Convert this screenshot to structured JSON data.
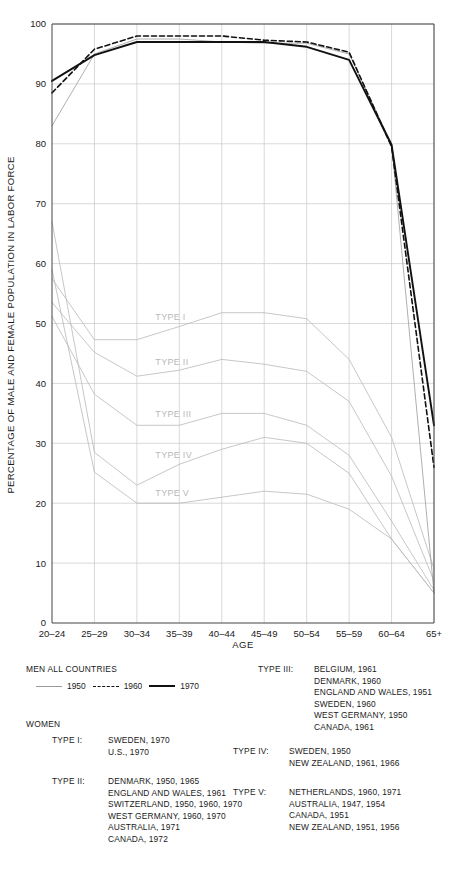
{
  "chart_data": {
    "type": "line",
    "title": "",
    "xlabel": "AGE",
    "ylabel": "PERCENTAGE OF MALE AND FEMALE POPULATION IN LABOR FORCE",
    "categories": [
      "20–24",
      "25–29",
      "30–34",
      "35–39",
      "40–44",
      "45–49",
      "50–54",
      "55–59",
      "60–64",
      "65+"
    ],
    "ylim": [
      0,
      100
    ],
    "yticks": [
      0,
      10,
      20,
      30,
      40,
      50,
      60,
      70,
      80,
      90,
      100
    ],
    "grid": true,
    "legend_position": "below-plot",
    "series": [
      {
        "name": "MEN ALL COUNTRIES 1950",
        "group": "men",
        "year": "1950",
        "style": "thin-grey-solid",
        "color": "#9a9a9a",
        "values": [
          83,
          95,
          97.5,
          97.5,
          97,
          96.8,
          96.8,
          95,
          80,
          5
        ]
      },
      {
        "name": "MEN ALL COUNTRIES 1960",
        "group": "men",
        "year": "1960",
        "style": "dashed-black",
        "color": "#111111",
        "values": [
          88.5,
          95.8,
          98,
          98,
          98,
          97.3,
          97,
          95.3,
          79.5,
          26
        ]
      },
      {
        "name": "MEN ALL COUNTRIES 1970",
        "group": "men",
        "year": "1970",
        "style": "thick-black-solid",
        "color": "#111111",
        "values": [
          90.5,
          94.8,
          97,
          97,
          97,
          97,
          96.2,
          94,
          79.8,
          33
        ]
      },
      {
        "name": "TYPE I",
        "group": "women",
        "style": "thin-grey-solid",
        "color": "#b9b9b9",
        "values": [
          57.5,
          47.3,
          47.3,
          49.5,
          51.8,
          51.8,
          50.8,
          44,
          31,
          9
        ]
      },
      {
        "name": "TYPE II",
        "group": "women",
        "style": "thin-grey-solid",
        "color": "#b9b9b9",
        "values": [
          53.5,
          45.2,
          41.2,
          42.2,
          44,
          43.2,
          42,
          37,
          24.5,
          7
        ]
      },
      {
        "name": "TYPE III",
        "group": "women",
        "style": "thin-grey-solid",
        "color": "#b9b9b9",
        "values": [
          51.2,
          38.2,
          33,
          33,
          35,
          35,
          33,
          28,
          17,
          5.5
        ]
      },
      {
        "name": "TYPE IV",
        "group": "women",
        "style": "thin-grey-solid",
        "color": "#b9b9b9",
        "values": [
          67,
          28.5,
          23,
          26.5,
          29,
          31,
          30,
          25,
          14,
          5
        ]
      },
      {
        "name": "TYPE V",
        "group": "women",
        "style": "thin-grey-solid",
        "color": "#b9b9b9",
        "values": [
          59,
          25.2,
          20,
          20,
          21,
          22,
          21.5,
          19,
          14,
          5
        ]
      }
    ],
    "inline_labels": [
      {
        "text": "TYPE I",
        "category": "35–39",
        "value": 50.6
      },
      {
        "text": "TYPE II",
        "category": "35–39",
        "value": 43.0
      },
      {
        "text": "TYPE III",
        "category": "35–39",
        "value": 34.4
      },
      {
        "text": "TYPE IV",
        "category": "35–39",
        "value": 27.6
      },
      {
        "text": "TYPE V",
        "category": "35–39",
        "value": 21.2
      }
    ]
  },
  "legend": {
    "men_heading": "MEN ALL COUNTRIES",
    "men_series": [
      {
        "label": "1950",
        "style": "thin-grey-solid"
      },
      {
        "label": "1960",
        "style": "dashed-black"
      },
      {
        "label": "1970",
        "style": "thick-black-solid"
      }
    ],
    "women_heading": "WOMEN",
    "women_types": [
      {
        "type": "TYPE I:",
        "countries": [
          "SWEDEN, 1970",
          "U.S., 1970"
        ]
      },
      {
        "type": "TYPE II:",
        "countries": [
          "DENMARK, 1950, 1965",
          "ENGLAND AND WALES, 1961",
          "SWITZERLAND, 1950, 1960, 1970",
          "WEST GERMANY, 1960, 1970",
          "AUSTRALIA, 1971",
          "CANADA, 1972"
        ]
      },
      {
        "type": "TYPE III:",
        "countries": [
          "BELGIUM, 1961",
          "DENMARK, 1960",
          "ENGLAND AND WALES, 1951",
          "SWEDEN, 1960",
          "WEST GERMANY, 1950",
          "CANADA, 1961"
        ]
      },
      {
        "type": "TYPE IV:",
        "countries": [
          "SWEDEN, 1950",
          "NEW ZEALAND, 1961, 1966"
        ]
      },
      {
        "type": "TYPE V:",
        "countries": [
          "NETHERLANDS, 1960, 1971",
          "AUSTRALIA, 1947, 1954",
          "CANADA, 1951",
          "NEW ZEALAND, 1951, 1956"
        ]
      }
    ]
  },
  "colors": {
    "grid": "#c9c9c9",
    "axis": "#555555",
    "men_1950": "#9a9a9a",
    "men_1960": "#111111",
    "men_1970": "#111111",
    "women_curve": "#b9b9b9",
    "type_label": "#b9b9b9"
  }
}
